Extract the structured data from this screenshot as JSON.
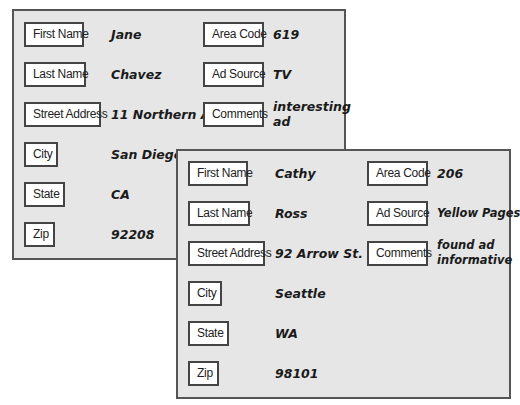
{
  "records": [
    {
      "fields_left": [
        {
          "label": "First Name",
          "value": "Jane"
        },
        {
          "label": "Last Name",
          "value": "Chavez"
        },
        {
          "label": "Street Address",
          "value": "11 Northern Ave."
        },
        {
          "label": "City",
          "value": "San Diego"
        },
        {
          "label": "State",
          "value": "CA"
        },
        {
          "label": "Zip",
          "value": "92208"
        }
      ],
      "fields_right": [
        {
          "label": "Area Code",
          "value": "619"
        },
        {
          "label": "Ad Source",
          "value": "TV"
        },
        {
          "label": "Comments",
          "value": "interesting ad"
        }
      ]
    },
    {
      "fields_left": [
        {
          "label": "First Name",
          "value": "Cathy"
        },
        {
          "label": "Last Name",
          "value": "Ross"
        },
        {
          "label": "Street Address",
          "value": "92 Arrow St."
        },
        {
          "label": "City",
          "value": "Seattle"
        },
        {
          "label": "State",
          "value": "WA"
        },
        {
          "label": "Zip",
          "value": "98101"
        }
      ],
      "fields_right": [
        {
          "label": "Area Code",
          "value": "206"
        },
        {
          "label": "Ad Source",
          "value": "Yellow Pages"
        },
        {
          "label": "Comments",
          "value": "found ad informative"
        }
      ]
    }
  ],
  "colors": {
    "card_background": "#e6e6e6",
    "card_border": "#555555",
    "label_background": "#ffffff",
    "text": "#1a1a1a"
  }
}
